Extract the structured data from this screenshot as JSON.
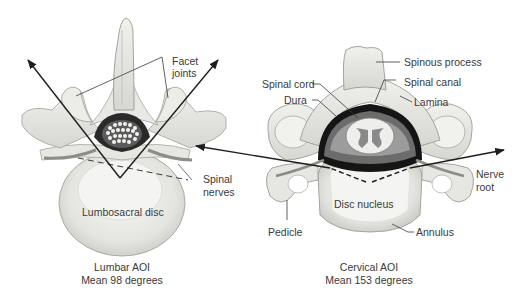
{
  "diagram": {
    "colors": {
      "bone_fill": "#e9e9e6",
      "bone_shade": "#cfcfcb",
      "bone_outline": "#9a9a96",
      "dura_dark": "#1a1a1a",
      "cord_grey": "#8a8a8a",
      "arrow": "#1e1e1e",
      "label_text": "#3a3a3a"
    },
    "lumbar": {
      "labels": {
        "facet_joints_1": "Facet",
        "facet_joints_2": "joints",
        "spinal_nerves_1": "Spinal",
        "spinal_nerves_2": "nerves",
        "disc": "Lumbosacral disc"
      },
      "caption_line1": "Lumbar AOI",
      "caption_line2": "Mean 98 degrees",
      "mean_angle_degrees": 98
    },
    "cervical": {
      "labels": {
        "spinous_process": "Spinous process",
        "spinal_cord": "Spinal cord",
        "spinal_canal": "Spinal canal",
        "dura": "Dura",
        "lamina": "Lamina",
        "nerve_root_1": "Nerve",
        "nerve_root_2": "root",
        "disc_nucleus": "Disc nucleus",
        "pedicle": "Pedicle",
        "annulus": "Annulus"
      },
      "caption_line1": "Cervical AOI",
      "caption_line2": "Mean 153 degrees",
      "mean_angle_degrees": 153
    }
  }
}
